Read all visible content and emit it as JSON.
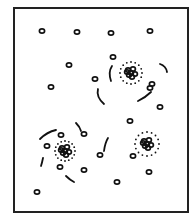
{
  "diagram": {
    "title": "",
    "colors": {
      "stroke": "#111111",
      "background": "#ffffff",
      "frame": "#222222"
    },
    "frame": {
      "x": 13,
      "y": 7,
      "width": 176,
      "height": 206
    },
    "free_particles": [
      [
        42,
        31
      ],
      [
        77,
        32
      ],
      [
        111,
        33
      ],
      [
        150,
        31
      ],
      [
        69,
        65
      ],
      [
        113,
        57
      ],
      [
        51,
        87
      ],
      [
        95,
        79
      ],
      [
        152,
        84
      ],
      [
        160,
        107
      ],
      [
        130,
        121
      ],
      [
        150,
        88
      ],
      [
        84,
        134
      ],
      [
        61,
        135
      ],
      [
        47,
        146
      ],
      [
        84,
        170
      ],
      [
        60,
        167
      ],
      [
        100,
        155
      ],
      [
        133,
        156
      ],
      [
        149,
        172
      ],
      [
        117,
        182
      ],
      [
        37,
        192
      ]
    ],
    "clusters": [
      {
        "name": "cluster-upper-right",
        "cx": 131,
        "cy": 73,
        "ring_r": 11
      },
      {
        "name": "cluster-lower-left",
        "cx": 65,
        "cy": 151,
        "ring_r": 10
      },
      {
        "name": "cluster-lower-right",
        "cx": 147,
        "cy": 144,
        "ring_r": 12
      }
    ],
    "arcs": [
      "M112 66 Q108 72 111 81",
      "M98 89 Q96 97 104 104",
      "M160 64 Q166 66 167 72",
      "M138 101 Q146 97 151 92",
      "M40 139 Q47 132 56 130",
      "M76 123 Q80 127 81 131",
      "M43 158 Q42 163 41 166",
      "M66 176 Q70 180 74 182",
      "M108 138 Q105 143 104 151"
    ]
  }
}
